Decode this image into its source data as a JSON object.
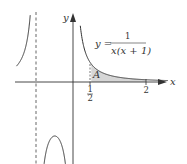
{
  "diagram": {
    "type": "function-graph",
    "function_label": {
      "lhs": "y =",
      "numerator": "1",
      "denominator": "x(x + 1)"
    },
    "axes": {
      "x_label": "x",
      "y_label": "y"
    },
    "region_label": "A",
    "ticks": [
      {
        "value": 0.5,
        "label_num": "1",
        "label_den": "2"
      },
      {
        "value": 2,
        "label": "2"
      }
    ],
    "asymptote_x": -1,
    "shaded_interval": [
      0.5,
      2
    ],
    "colors": {
      "curve": "#333333",
      "axis": "#333333",
      "shade": "#d6d6d6",
      "dashed": "#555555",
      "background": "#ffffff"
    }
  }
}
